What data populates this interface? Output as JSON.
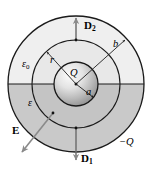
{
  "figure": {
    "colors": {
      "outline": "#1a1a1a",
      "upper_region_fill": "#efefef",
      "lower_region_fill": "#c9c9c9",
      "middle_upper_fill": "#e4e4e4",
      "middle_lower_fill": "#c0c0c0",
      "sphere_light": "#f2f2f2",
      "sphere_dark": "#8f8f8f",
      "arrow_gray": "#8a8a8a",
      "arrow_dark": "#3a3a3a",
      "background": "#ffffff"
    },
    "geometry": {
      "center_x": 76,
      "center_y": 84,
      "outer_radius": 68,
      "middle_radius": 44,
      "inner_radius": 22
    },
    "labels": {
      "d2": {
        "text": "D",
        "subscript": "2",
        "role": "displacement-vector-upper"
      },
      "d1": {
        "text": "D",
        "subscript": "1",
        "role": "displacement-vector-lower"
      },
      "e_field": {
        "text": "E",
        "role": "electric-field-vector"
      },
      "epsilon_zero": {
        "text": "ε",
        "subscript": "0",
        "role": "permittivity-free-space"
      },
      "epsilon": {
        "text": "ε",
        "role": "permittivity-dielectric"
      },
      "charge_center": {
        "text": "Q",
        "role": "center-charge"
      },
      "radius_a": {
        "text": "a",
        "role": "inner-radius-label"
      },
      "radius_b": {
        "text": "b",
        "role": "outer-radius-label"
      },
      "radius_r": {
        "text": "r",
        "role": "gaussian-radius-label"
      },
      "charge_outer": {
        "text": "−Q",
        "role": "outer-shell-charge"
      }
    }
  }
}
